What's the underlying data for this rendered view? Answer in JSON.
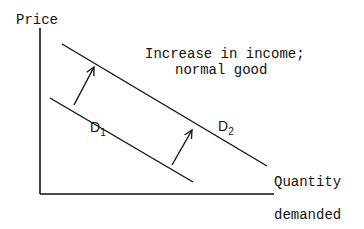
{
  "diagram": {
    "title_line1": "Increase in income;",
    "title_line2": "normal good",
    "y_axis_label": "Price",
    "x_axis_label_line1": "Quantity",
    "x_axis_label_line2": "demanded",
    "curves": [
      {
        "label": "D",
        "subscript": "1",
        "name": "original demand"
      },
      {
        "label": "D",
        "subscript": "2",
        "name": "new demand"
      }
    ],
    "shift_direction": "right"
  }
}
